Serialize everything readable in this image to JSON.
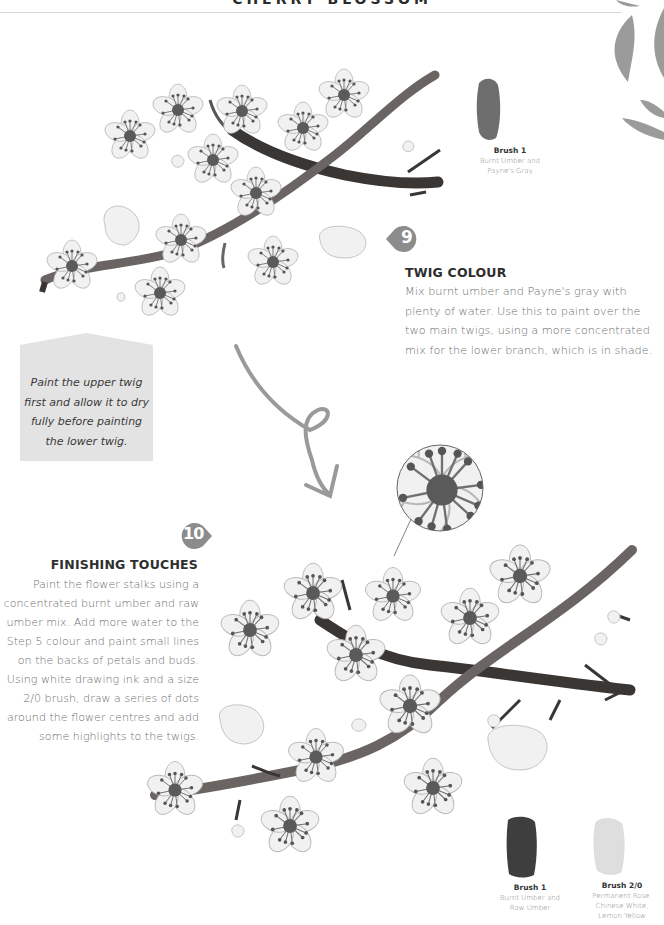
{
  "header": {
    "title": "CHERRY BLOSSOM"
  },
  "step9": {
    "number": "9",
    "title": "TWIG COLOUR",
    "body": "Mix burnt umber and Payne's gray with plenty of water. Use this to paint over the two main twigs, using a more concentrated mix for the lower branch, which is in shade.",
    "swatch": {
      "name": "Brush 1",
      "description": [
        "Burnt Umber and",
        "Payne's Gray"
      ]
    }
  },
  "note": {
    "text": "Paint the upper twig first and allow it to dry fully before painting the lower twig."
  },
  "step10": {
    "number": "10",
    "title": "FINISHING TOUCHES",
    "body": "Paint the flower stalks using a concentrated burnt umber and raw umber mix. Add more water to the Step 5 colour and paint small lines on the backs of petals and buds. Using white drawing ink and a size 2/0 brush, draw a series of dots around the flower centres and add some highlights to the twigs.",
    "swatches": [
      {
        "name": "Brush 1",
        "description": [
          "Burnt Umber and",
          "Raw Umber"
        ]
      },
      {
        "name": "Brush 2/0",
        "description": [
          "Permanent Rose,",
          "Chinese White,",
          "Lemon Yellow"
        ]
      }
    ]
  },
  "colors": {
    "badge": "#8c8c8c",
    "note_background": "#e3e3e3",
    "arrow": "#9a9a9a",
    "twig_dark": "#3e3a38",
    "twig_mid": "#6a6462"
  }
}
